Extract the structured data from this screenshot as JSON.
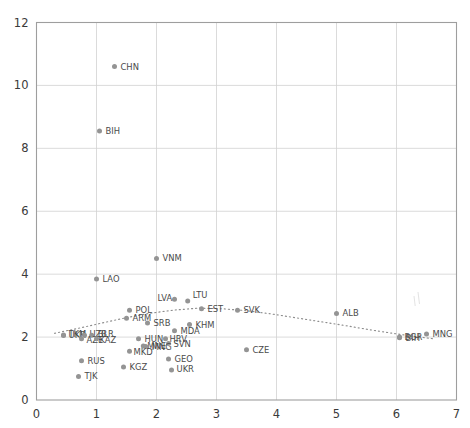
{
  "chart_data": {
    "type": "scatter",
    "title": "",
    "xlabel": "",
    "ylabel": "",
    "xlim": [
      0,
      7
    ],
    "ylim": [
      0,
      12
    ],
    "xticks": [
      0,
      1,
      2,
      3,
      4,
      5,
      6,
      7
    ],
    "yticks": [
      0,
      2,
      4,
      6,
      8,
      10,
      12
    ],
    "grid": true,
    "legend": "none",
    "marker_color": "#949494",
    "label_color": "#4a4a4a",
    "grid_color": "#d2d2d2",
    "axis_color": "#9e9e9e",
    "points": [
      {
        "label": "CHN",
        "x": 1.3,
        "y": 10.6
      },
      {
        "label": "BIH",
        "x": 1.05,
        "y": 8.55
      },
      {
        "label": "VNM",
        "x": 2.0,
        "y": 4.5
      },
      {
        "label": "LAO",
        "x": 1.0,
        "y": 3.85
      },
      {
        "label": "LVA",
        "x": 2.3,
        "y": 3.2
      },
      {
        "label": "LTU",
        "x": 2.52,
        "y": 3.15
      },
      {
        "label": "EST",
        "x": 2.75,
        "y": 2.9
      },
      {
        "label": "POL",
        "x": 1.55,
        "y": 2.85
      },
      {
        "label": "SVK",
        "x": 3.35,
        "y": 2.85
      },
      {
        "label": "ALB",
        "x": 5.0,
        "y": 2.75
      },
      {
        "label": "ARM",
        "x": 1.5,
        "y": 2.6
      },
      {
        "label": "SRB",
        "x": 1.85,
        "y": 2.45
      },
      {
        "label": "KHM",
        "x": 2.55,
        "y": 2.4
      },
      {
        "label": "MDA",
        "x": 2.3,
        "y": 2.2
      },
      {
        "label": "MNG",
        "x": 6.5,
        "y": 2.1
      },
      {
        "label": "TKM",
        "x": 0.45,
        "y": 2.07
      },
      {
        "label": "UKR",
        "x": 0.45,
        "y": 2.05
      },
      {
        "label": "UZB",
        "x": 0.8,
        "y": 2.06
      },
      {
        "label": "BLR",
        "x": 0.92,
        "y": 2.06
      },
      {
        "label": "BGR",
        "x": 6.05,
        "y": 2.0
      },
      {
        "label": "BIH",
        "x": 6.05,
        "y": 1.98
      },
      {
        "label": "AZE",
        "x": 0.75,
        "y": 1.95
      },
      {
        "label": "KAZ",
        "x": 1.0,
        "y": 1.95
      },
      {
        "label": "HUN",
        "x": 1.7,
        "y": 1.95
      },
      {
        "label": "HRV",
        "x": 2.15,
        "y": 1.95
      },
      {
        "label": "SVN",
        "x": 2.2,
        "y": 1.8
      },
      {
        "label": "MNE",
        "x": 1.78,
        "y": 1.72
      },
      {
        "label": "MNG",
        "x": 1.82,
        "y": 1.7
      },
      {
        "label": "CZE",
        "x": 3.5,
        "y": 1.6
      },
      {
        "label": "MKD",
        "x": 1.55,
        "y": 1.55
      },
      {
        "label": "GEO",
        "x": 2.2,
        "y": 1.3
      },
      {
        "label": "RUS",
        "x": 0.75,
        "y": 1.25
      },
      {
        "label": "KGZ",
        "x": 1.45,
        "y": 1.05
      },
      {
        "label": "UKR",
        "x": 2.25,
        "y": 0.95
      },
      {
        "label": "TJK",
        "x": 0.7,
        "y": 0.75
      }
    ],
    "trendline": {
      "style": "dotted",
      "shape": "quadratic",
      "points": [
        {
          "x": 0.3,
          "y": 2.12
        },
        {
          "x": 0.7,
          "y": 2.28
        },
        {
          "x": 1.1,
          "y": 2.45
        },
        {
          "x": 1.5,
          "y": 2.62
        },
        {
          "x": 1.9,
          "y": 2.76
        },
        {
          "x": 2.3,
          "y": 2.86
        },
        {
          "x": 2.7,
          "y": 2.92
        },
        {
          "x": 3.1,
          "y": 2.9
        },
        {
          "x": 3.5,
          "y": 2.84
        },
        {
          "x": 3.9,
          "y": 2.74
        },
        {
          "x": 4.3,
          "y": 2.62
        },
        {
          "x": 4.7,
          "y": 2.5
        },
        {
          "x": 5.1,
          "y": 2.38
        },
        {
          "x": 5.5,
          "y": 2.25
        },
        {
          "x": 5.9,
          "y": 2.13
        },
        {
          "x": 6.3,
          "y": 2.02
        },
        {
          "x": 6.6,
          "y": 1.95
        }
      ]
    }
  },
  "label_offsets": {
    "CHN": [
      6,
      3
    ],
    "BIH": [
      6,
      3
    ],
    "VNM": [
      6,
      3
    ],
    "LAO": [
      6,
      3
    ],
    "LVA": [
      -17,
      2
    ],
    "LTU": [
      5,
      -3
    ],
    "EST": [
      6,
      3
    ],
    "POL": [
      6,
      3
    ],
    "SVK": [
      6,
      3
    ],
    "ALB": [
      6,
      3
    ],
    "ARM": [
      6,
      3
    ],
    "SRB": [
      6,
      3
    ],
    "KHM": [
      6,
      3
    ],
    "MDA": [
      6,
      3
    ],
    "MNG": [
      6,
      3
    ],
    "TKM": [
      5,
      2
    ],
    "UKR": [
      5,
      2
    ],
    "UZB": [
      5,
      2
    ],
    "BLR": [
      6,
      2
    ],
    "BGR": [
      5,
      3
    ],
    "AZE": [
      5,
      4
    ],
    "KAZ": [
      3,
      4
    ],
    "HUN": [
      6,
      3
    ],
    "HRV": [
      4,
      3
    ],
    "SVN": [
      5,
      4
    ],
    "MNE": [
      4,
      3
    ],
    "CZE": [
      6,
      3
    ],
    "MKD": [
      4,
      4
    ],
    "GEO": [
      6,
      3
    ],
    "RUS": [
      6,
      3
    ],
    "KGZ": [
      6,
      3
    ],
    "TJK": [
      6,
      3
    ]
  }
}
